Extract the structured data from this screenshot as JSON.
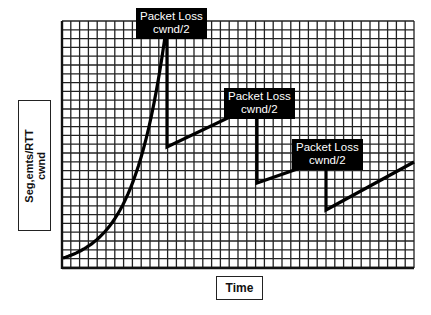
{
  "diagram": {
    "title": "",
    "y_axis_label_line1": "Seg,emts/RTT",
    "y_axis_label_line2": "cwnd",
    "x_axis_label": "Time",
    "colors": {
      "background": "#ffffff",
      "grid": "#222222",
      "curve": "#000000",
      "callout_bg": "#000000",
      "callout_text": "#ffffff"
    },
    "grid": {
      "left": 62,
      "top": 21,
      "right": 414,
      "bottom": 268,
      "cell": 8.8
    },
    "callouts": [
      {
        "line1": "Packet Loss",
        "line2": "cwnd/2",
        "left": 136,
        "top": 8,
        "width": 66,
        "height": 33
      },
      {
        "line1": "Packet Loss",
        "line2": "cwnd/2",
        "left": 224,
        "top": 88,
        "width": 66,
        "height": 33
      },
      {
        "line1": "Packet Loss",
        "line2": "cwnd/2",
        "left": 292,
        "top": 139,
        "width": 66,
        "height": 33
      }
    ],
    "phases": [
      {
        "name": "slow-start",
        "shape": "exponential",
        "from": [
          63,
          258
        ],
        "to": [
          167,
          22
        ]
      },
      {
        "name": "loss-1-drop",
        "shape": "vertical",
        "from": [
          167,
          22
        ],
        "to": [
          167,
          147
        ]
      },
      {
        "name": "congestion-avoidance-1",
        "shape": "linear",
        "from": [
          167,
          147
        ],
        "to": [
          257,
          104
        ]
      },
      {
        "name": "loss-2-drop",
        "shape": "vertical",
        "from": [
          257,
          104
        ],
        "to": [
          257,
          183
        ]
      },
      {
        "name": "congestion-avoidance-2",
        "shape": "linear",
        "from": [
          257,
          183
        ],
        "to": [
          326,
          159
        ]
      },
      {
        "name": "loss-3-drop",
        "shape": "vertical",
        "from": [
          326,
          159
        ],
        "to": [
          326,
          210
        ]
      },
      {
        "name": "congestion-avoidance-3",
        "shape": "linear",
        "from": [
          326,
          210
        ],
        "to": [
          414,
          162
        ]
      }
    ]
  }
}
